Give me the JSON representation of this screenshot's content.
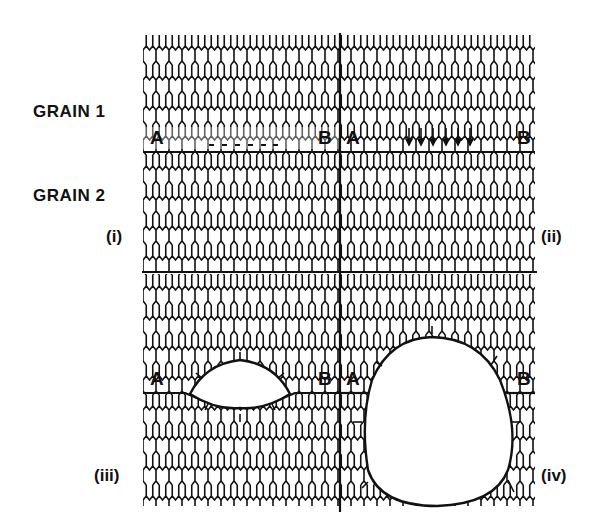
{
  "labels": {
    "grain1": "GRAIN 1",
    "grain2": "GRAIN 2"
  },
  "panels": [
    {
      "id": "i",
      "label": "(i)",
      "point_a": "A",
      "point_b": "B",
      "state": "dashed line of vacancies along grain boundary"
    },
    {
      "id": "ii",
      "label": "(ii)",
      "point_a": "A",
      "point_b": "B",
      "state": "arrows pointing toward boundary (vacancy flux)"
    },
    {
      "id": "iii",
      "label": "(iii)",
      "point_a": "A",
      "point_b": "B",
      "state": "lens-shaped cavity on boundary"
    },
    {
      "id": "iv",
      "label": "(iv)",
      "point_a": "A",
      "point_b": "B",
      "state": "large rounded cavity consuming grains"
    }
  ],
  "colors": {
    "ink": "#111111",
    "background": "#ffffff"
  }
}
